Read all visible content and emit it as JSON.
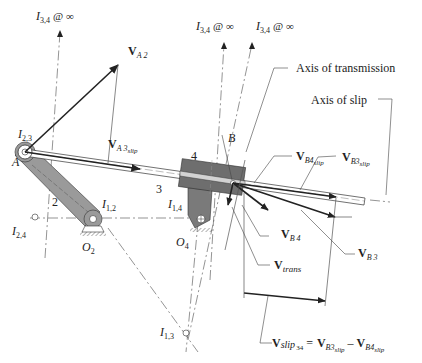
{
  "diagram": {
    "instant_centers": {
      "i34_left": {
        "main": "I",
        "sub": "3,4",
        "suffix": "@ ∞"
      },
      "i34_mid": {
        "main": "I",
        "sub": "3,4",
        "suffix": "@ ∞"
      },
      "i34_right": {
        "main": "I",
        "sub": "3,4",
        "suffix": "@ ∞"
      },
      "i23": {
        "main": "I",
        "sub": "2,3"
      },
      "i12": {
        "main": "I",
        "sub": "1,2"
      },
      "i14": {
        "main": "I",
        "sub": "1,4"
      },
      "i24": {
        "main": "I",
        "sub": "2,4"
      },
      "i13": {
        "main": "I",
        "sub": "1,3"
      }
    },
    "points": {
      "A": "A",
      "B": "B",
      "O2": {
        "main": "O",
        "sub": "2"
      },
      "O4": {
        "main": "O",
        "sub": "4"
      }
    },
    "links": {
      "link2": "2",
      "link3": "3",
      "link4": "4"
    },
    "axes": {
      "transmission": "Axis of transmission",
      "slip": "Axis of slip"
    },
    "vectors": {
      "VA2": {
        "main": "V",
        "sub": "A 2"
      },
      "VA3slip": {
        "main": "V",
        "sub": "A 3",
        "subsub": "slip"
      },
      "VB4slip": {
        "main": "V",
        "sub": "B4",
        "subsub": "slip"
      },
      "VB3slip": {
        "main": "V",
        "sub": "B3",
        "subsub": "slip"
      },
      "VB4": {
        "main": "V",
        "sub": "B 4"
      },
      "VB3": {
        "main": "V",
        "sub": "B 3"
      },
      "Vtrans": {
        "main": "V",
        "sub": "trans"
      }
    },
    "equation": {
      "lhs_main": "V",
      "lhs_sub": "slip",
      "lhs_subsub": "34",
      "equals": "=",
      "t1_main": "V",
      "t1_sub": "B3",
      "t1_subsub": "slip",
      "minus": "–",
      "t2_main": "V",
      "t2_sub": "B4",
      "t2_subsub": "slip"
    },
    "colors": {
      "link_fill": "#9a9a9a",
      "block_fill": "#6e6e6e",
      "line": "#222222",
      "construction": "#666666"
    }
  }
}
